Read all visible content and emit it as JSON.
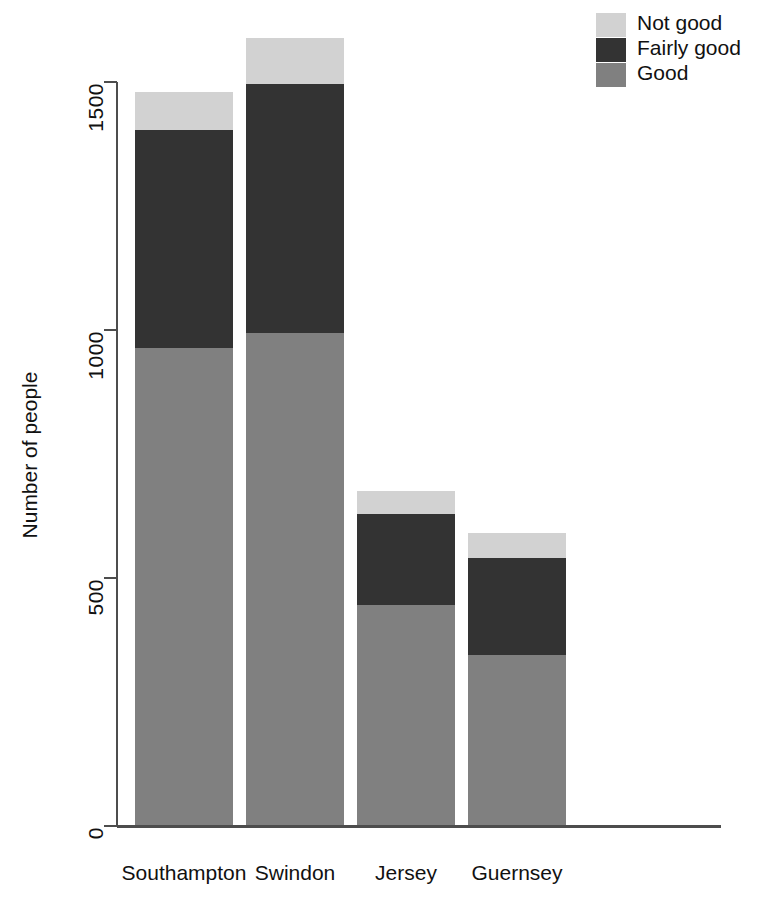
{
  "chart_data": {
    "type": "bar",
    "subtype": "stacked-vertical",
    "title": "",
    "xlabel": "",
    "ylabel": "Number of people",
    "ylim": [
      0,
      1600
    ],
    "yticks": [
      0,
      500,
      1000,
      1500
    ],
    "ytick_labels": [
      "0",
      "500",
      "1000",
      "1500"
    ],
    "grid": false,
    "legend_position": "top-right",
    "categories": [
      "Southampton",
      "Swindon",
      "Jersey",
      "Guernsey"
    ],
    "series": [
      {
        "name": "Good",
        "color": "#808080",
        "values": [
          964,
          994,
          446,
          345
        ]
      },
      {
        "name": "Fairly good",
        "color": "#333333",
        "values": [
          439,
          502,
          183,
          195
        ]
      },
      {
        "name": "Not good",
        "color": "#d2d2d2",
        "values": [
          77,
          93,
          46,
          51
        ]
      }
    ],
    "totals": [
      1480,
      1589,
      675,
      591
    ],
    "legend_order": [
      "Not good",
      "Fairly good",
      "Good"
    ]
  },
  "legend": {
    "items": [
      {
        "label": "Not good",
        "color": "#d2d2d2"
      },
      {
        "label": "Fairly good",
        "color": "#333333"
      },
      {
        "label": "Good",
        "color": "#808080"
      }
    ]
  },
  "axes": {
    "y": {
      "title": "Number of people",
      "ticks": [
        {
          "label": "1500",
          "value": 1500
        },
        {
          "label": "1000",
          "value": 1000
        },
        {
          "label": "500",
          "value": 500
        },
        {
          "label": "0",
          "value": 0
        }
      ]
    },
    "x": {
      "ticks": [
        {
          "label": "Southampton"
        },
        {
          "label": "Swindon"
        },
        {
          "label": "Jersey"
        },
        {
          "label": "Guernsey"
        }
      ]
    }
  }
}
